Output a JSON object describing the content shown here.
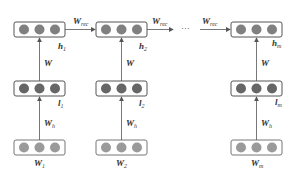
{
  "diagram": {
    "type": "recurrent-network-unrolled",
    "columns": [
      {
        "id": "1",
        "hidden": "h",
        "hidden_sub": "1",
        "intermediate": "l",
        "intermediate_sub": "1",
        "input": "W",
        "input_sub": "1"
      },
      {
        "id": "2",
        "hidden": "h",
        "hidden_sub": "2",
        "intermediate": "l",
        "intermediate_sub": "2",
        "input": "W",
        "input_sub": "2"
      },
      {
        "id": "m",
        "hidden": "h",
        "hidden_sub": "m",
        "intermediate": "l",
        "intermediate_sub": "m",
        "input": "W",
        "input_sub": "m"
      }
    ],
    "edge_labels": {
      "recurrent": "W",
      "recurrent_sub": "rec",
      "vertical_upper": "W",
      "vertical_lower": "W",
      "vertical_lower_sub": "h",
      "ellipsis": "···"
    },
    "colors": {
      "top_node": "#808080",
      "middle_node": "#666666",
      "bottom_node": "#9a9a9a",
      "box_stroke": "#555555",
      "arrow": "#555555"
    }
  }
}
